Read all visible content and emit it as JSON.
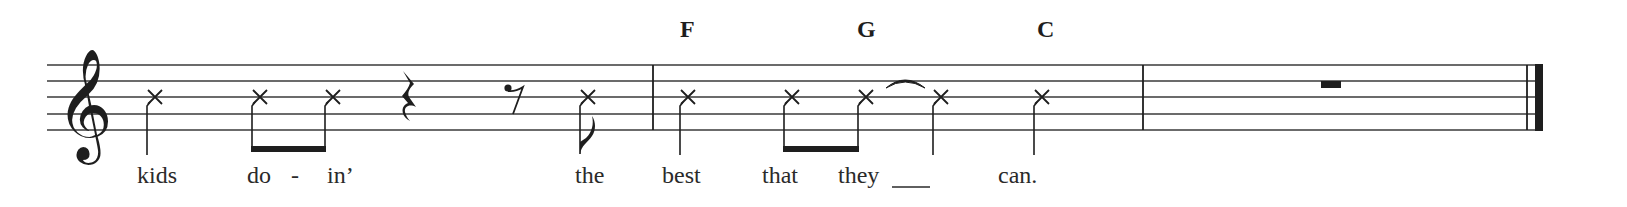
{
  "score": {
    "clef": "treble",
    "notehead_style": "x",
    "ink_color": "#1e1e1e",
    "staff_line_color": "#3a3a3a",
    "measures": 3,
    "chords": [
      {
        "symbol": "F",
        "x": 680
      },
      {
        "symbol": "G",
        "x": 857
      },
      {
        "symbol": "C",
        "x": 1037
      }
    ],
    "lyrics": [
      {
        "text": "kids",
        "x": 137
      },
      {
        "text": "do",
        "x": 247
      },
      {
        "text": "-",
        "x": 291
      },
      {
        "text": "in’",
        "x": 327
      },
      {
        "text": "the",
        "x": 575
      },
      {
        "text": "best",
        "x": 662
      },
      {
        "text": "that",
        "x": 762
      },
      {
        "text": "they",
        "x": 838
      },
      {
        "text": "can.",
        "x": 998
      }
    ],
    "notes": [
      {
        "lyric": "kids",
        "duration": "quarter",
        "x": 155
      },
      {
        "lyric": "do",
        "duration": "eighth",
        "x": 260,
        "beamed": true
      },
      {
        "lyric": "in’",
        "duration": "eighth",
        "x": 333,
        "beamed": true
      },
      {
        "rest": "quarter",
        "x": 409
      },
      {
        "rest": "eighth",
        "x": 513
      },
      {
        "lyric": "the",
        "duration": "eighth",
        "x": 588
      },
      {
        "lyric": "best",
        "duration": "quarter",
        "x": 688
      },
      {
        "lyric": "that",
        "duration": "eighth",
        "x": 792,
        "beamed": true
      },
      {
        "lyric": "they",
        "duration": "eighth",
        "x": 866,
        "beamed": true,
        "tied": true
      },
      {
        "lyric": "(tied)",
        "duration": "quarter",
        "x": 941
      },
      {
        "lyric": "can.",
        "duration": "quarter",
        "x": 1042
      },
      {
        "rest": "whole",
        "x": 1331
      }
    ],
    "barlines": [
      653,
      1143
    ],
    "final_barline": "thin-thick"
  }
}
